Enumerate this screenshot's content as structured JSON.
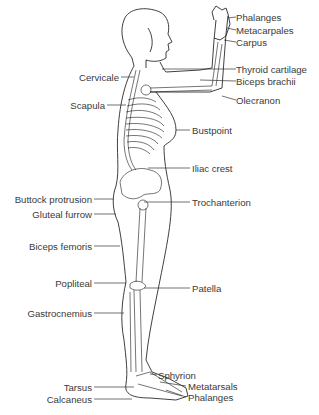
{
  "figure": {
    "type": "anatomical landmark diagram"
  },
  "labels_right": [
    {
      "id": "phalanges-hand",
      "text": "Phalanges",
      "x": 236,
      "y": 12
    },
    {
      "id": "metacarpales",
      "text": "Metacarpales",
      "x": 236,
      "y": 25
    },
    {
      "id": "carpus",
      "text": "Carpus",
      "x": 236,
      "y": 37
    },
    {
      "id": "thyroid-cartilage",
      "text": "Thyroid cartilage",
      "x": 236,
      "y": 64
    },
    {
      "id": "biceps-brachii",
      "text": "Biceps brachii",
      "x": 236,
      "y": 76
    },
    {
      "id": "olecranon",
      "text": "Olecranon",
      "x": 236,
      "y": 95
    },
    {
      "id": "bustpoint",
      "text": "Bustpoint",
      "x": 192,
      "y": 125
    },
    {
      "id": "iliac-crest",
      "text": "Iliac crest",
      "x": 192,
      "y": 163
    },
    {
      "id": "trochanterion",
      "text": "Trochanterion",
      "x": 192,
      "y": 197
    },
    {
      "id": "patella",
      "text": "Patella",
      "x": 192,
      "y": 283
    },
    {
      "id": "sphyrion",
      "text": "Sphyrion",
      "x": 158,
      "y": 370
    },
    {
      "id": "metatarsals",
      "text": "Metatarsals",
      "x": 188,
      "y": 381
    },
    {
      "id": "phalanges-foot",
      "text": "Phalanges",
      "x": 188,
      "y": 392
    }
  ],
  "labels_left": [
    {
      "id": "cervicale",
      "text": "Cervicale",
      "x": 80,
      "y": 72
    },
    {
      "id": "scapula",
      "text": "Scapula",
      "x": 66,
      "y": 100
    },
    {
      "id": "buttock-protrusion",
      "text": "Buttock protrusion",
      "x": 92,
      "y": 194
    },
    {
      "id": "gluteal-furrow",
      "text": "Gluteal furrow",
      "x": 92,
      "y": 209
    },
    {
      "id": "biceps-femoris",
      "text": "Biceps femoris",
      "x": 92,
      "y": 241
    },
    {
      "id": "popliteal",
      "text": "Popliteal",
      "x": 92,
      "y": 278
    },
    {
      "id": "gastrocnemius",
      "text": "Gastrocnemius",
      "x": 92,
      "y": 308
    },
    {
      "id": "tarsus",
      "text": "Tarsus",
      "x": 92,
      "y": 382
    },
    {
      "id": "calcaneus",
      "text": "Calcaneus",
      "x": 92,
      "y": 394
    }
  ]
}
